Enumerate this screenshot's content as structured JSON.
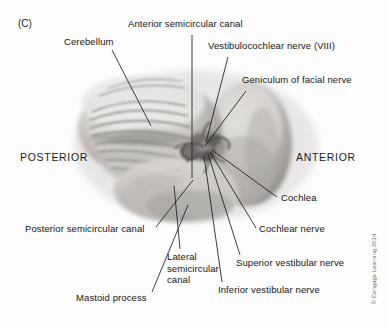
{
  "figure": {
    "panel_tag": "(C)",
    "credit": "© Cengage Learning 2014",
    "orientation": {
      "posterior": "POSTERIOR",
      "anterior": "ANTERIOR"
    }
  },
  "labels": [
    {
      "id": "cerebellum",
      "text": "Cerebellum"
    },
    {
      "id": "anterior-semicircular-canal",
      "text": "Anterior semicircular canal"
    },
    {
      "id": "vestibulocochlear-nerve",
      "text": "Vestibulocochlear nerve (VIII)"
    },
    {
      "id": "geniculum-of-facial-nerve",
      "text": "Geniculum of facial nerve"
    },
    {
      "id": "cochlea",
      "text": "Cochlea"
    },
    {
      "id": "cochlear-nerve",
      "text": "Cochlear nerve"
    },
    {
      "id": "superior-vestibular-nerve",
      "text": "Superior vestibular nerve"
    },
    {
      "id": "inferior-vestibular-nerve",
      "text": "Inferior vestibular nerve"
    },
    {
      "id": "lateral-semicircular-canal",
      "text": "Lateral\nsemicircular\ncanal"
    },
    {
      "id": "posterior-semicircular-canal",
      "text": "Posterior semicircular canal"
    },
    {
      "id": "mastoid-process",
      "text": "Mastoid process"
    }
  ],
  "colors": {
    "background": "#fdfdfd",
    "text": "#141414",
    "leader_line": "#1b1b1b",
    "credit_text": "#6b6b6b",
    "specimen_light": "#f0efee",
    "specimen_mid": "#b9b6b3",
    "specimen_dark": "#6e6b68"
  }
}
